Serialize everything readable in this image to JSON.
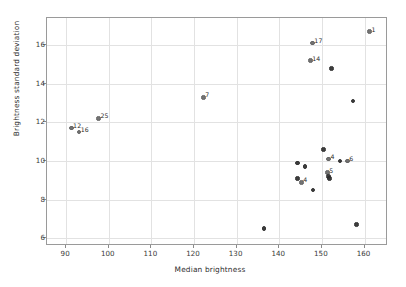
{
  "chart_data": {
    "type": "scatter",
    "title": "",
    "xlabel": "Median brightness",
    "ylabel": "Brightness standard deviation",
    "xlim": [
      85.5,
      165.5
    ],
    "ylim": [
      5.6,
      17.4
    ],
    "xticks": [
      90,
      100,
      110,
      120,
      130,
      140,
      150,
      160
    ],
    "yticks": [
      6,
      8,
      10,
      12,
      14,
      16
    ],
    "grid": true,
    "legend": false,
    "marker_color": "#5b5b5b",
    "points": [
      {
        "x": 161.2,
        "y": 16.7,
        "label": "1"
      },
      {
        "x": 147.8,
        "y": 16.1,
        "label": "17"
      },
      {
        "x": 147.3,
        "y": 15.2,
        "label": "14"
      },
      {
        "x": 152.2,
        "y": 14.8,
        "label": ""
      },
      {
        "x": 122.2,
        "y": 13.3,
        "label": "7"
      },
      {
        "x": 157.3,
        "y": 13.1,
        "label": ""
      },
      {
        "x": 97.6,
        "y": 12.2,
        "label": "25"
      },
      {
        "x": 91.2,
        "y": 11.7,
        "label": "12"
      },
      {
        "x": 93.0,
        "y": 11.5,
        "label": "16"
      },
      {
        "x": 150.4,
        "y": 10.6,
        "label": ""
      },
      {
        "x": 151.6,
        "y": 10.1,
        "label": "4"
      },
      {
        "x": 154.2,
        "y": 10.0,
        "label": ""
      },
      {
        "x": 156.0,
        "y": 10.0,
        "label": "6"
      },
      {
        "x": 144.2,
        "y": 9.9,
        "label": ""
      },
      {
        "x": 146.0,
        "y": 9.7,
        "label": ""
      },
      {
        "x": 151.3,
        "y": 9.4,
        "label": "5"
      },
      {
        "x": 151.6,
        "y": 9.2,
        "label": ""
      },
      {
        "x": 151.8,
        "y": 9.1,
        "label": ""
      },
      {
        "x": 144.3,
        "y": 9.1,
        "label": ""
      },
      {
        "x": 145.2,
        "y": 8.9,
        "label": "4"
      },
      {
        "x": 147.9,
        "y": 8.5,
        "label": ""
      },
      {
        "x": 136.4,
        "y": 6.5,
        "label": ""
      },
      {
        "x": 158.1,
        "y": 6.7,
        "label": ""
      }
    ]
  }
}
